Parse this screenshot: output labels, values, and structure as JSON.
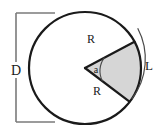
{
  "figure": {
    "kind": "circle-sector-geometry-diagram",
    "background_color": "#ffffff",
    "stroke_color": "#1a1a1a",
    "dimension_line_color": "#7a7a7a",
    "sector_fill_color": "#d6d6d6",
    "labels": {
      "diameter": "D",
      "radius_upper": "R",
      "radius_lower": "R",
      "angle": "a",
      "arc_length": "L"
    },
    "geometry": {
      "circle_center_x": 85,
      "circle_center_y": 68,
      "circle_radius": 56,
      "sector_start_angle_deg": -37,
      "sector_end_angle_deg": 28,
      "angle_arc_radius": 22,
      "outer_arc_radius": 66,
      "dimension_line_x": 16,
      "dimension_line_top_y": 13,
      "dimension_line_bottom_y": 122
    }
  }
}
